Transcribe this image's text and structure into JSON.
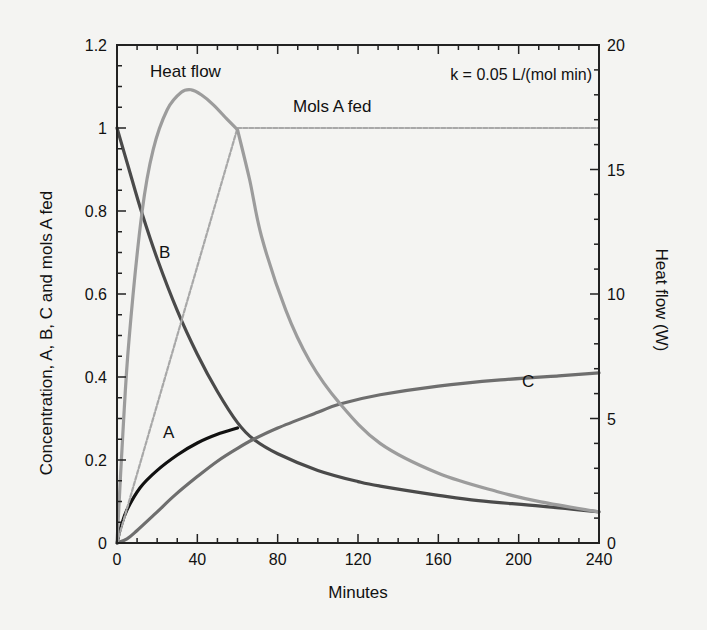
{
  "chart_data": {
    "type": "line",
    "title": "",
    "annotation": "k = 0.05 L/(mol min)",
    "xlabel": "Minutes",
    "ylabel": "Concentration, A, B, C and mols A fed",
    "y2label": "Heat flow (W)",
    "xlim": [
      0,
      240
    ],
    "ylim": [
      0,
      1.2
    ],
    "y2lim": [
      0,
      20
    ],
    "xticks": [
      0,
      40,
      80,
      120,
      160,
      200,
      240
    ],
    "yticks": [
      "0",
      "0.2",
      "0.4",
      "0.6",
      "0.8",
      "1",
      "1.2"
    ],
    "y2ticks": [
      "0",
      "5",
      "10",
      "15",
      "20"
    ],
    "grid": false,
    "series": [
      {
        "name": "A",
        "label": "A",
        "axis": "left",
        "color": "#111111",
        "width": 3.2,
        "dash": "",
        "label_pos": [
          163,
          438
        ],
        "x": [
          0,
          2,
          5,
          11.5,
          20,
          30,
          40,
          50,
          60
        ],
        "y": [
          0,
          0.04,
          0.08,
          0.133,
          0.175,
          0.212,
          0.241,
          0.262,
          0.277
        ]
      },
      {
        "name": "B",
        "label": "B",
        "axis": "left",
        "color": "#4a4a4a",
        "width": 3.2,
        "dash": "",
        "label_pos": [
          159,
          258
        ],
        "x": [
          0,
          6,
          12.4,
          20,
          30,
          40,
          50,
          60,
          68,
          80,
          100,
          120,
          131,
          160,
          180,
          211,
          240
        ],
        "y": [
          1.0,
          0.9,
          0.795,
          0.685,
          0.56,
          0.455,
          0.365,
          0.29,
          0.25,
          0.215,
          0.175,
          0.148,
          0.137,
          0.115,
          0.102,
          0.089,
          0.075
        ]
      },
      {
        "name": "C",
        "label": "C",
        "axis": "left",
        "color": "#6e6e6e",
        "width": 3.2,
        "dash": "",
        "label_pos": [
          522,
          387
        ],
        "x": [
          0,
          5,
          10,
          20,
          29,
          40,
          50,
          60,
          68,
          80,
          100,
          111,
          131,
          160,
          191,
          220,
          240
        ],
        "y": [
          0,
          0.01,
          0.03,
          0.075,
          0.116,
          0.16,
          0.197,
          0.228,
          0.25,
          0.277,
          0.315,
          0.335,
          0.357,
          0.378,
          0.393,
          0.403,
          0.41
        ]
      },
      {
        "name": "Mols A fed",
        "label": "Mols A fed",
        "axis": "left",
        "color": "#a8a8a8",
        "width": 2.2,
        "dash": "4 2",
        "label_pos": [
          293,
          112
        ],
        "x": [
          0,
          60,
          240
        ],
        "y": [
          0,
          1.0,
          1.0
        ]
      },
      {
        "name": "Heat flow",
        "label": "Heat flow",
        "axis": "right",
        "color": "#9c9c9c",
        "width": 3.2,
        "dash": "",
        "label_pos": [
          150,
          77
        ],
        "x": [
          0,
          3,
          6,
          12.4,
          18,
          25,
          32,
          37,
          42,
          48,
          55,
          60,
          66,
          72,
          84,
          96,
          111,
          131,
          160,
          190,
          211,
          240
        ],
        "y": [
          0,
          4.5,
          8.2,
          13.25,
          15.8,
          17.4,
          18.1,
          18.2,
          18.0,
          17.6,
          17.0,
          16.6,
          14.6,
          12.3,
          9.36,
          7.3,
          5.6,
          4.0,
          2.8,
          2.05,
          1.65,
          1.25
        ]
      }
    ]
  }
}
